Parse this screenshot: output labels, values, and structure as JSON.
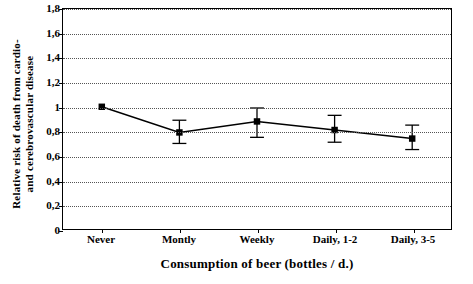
{
  "chart_data": {
    "type": "line",
    "title": "",
    "xlabel": "Consumption of beer (bottles / d.)",
    "ylabel": "Relative risk of death from cardio- and cerebrovascular disease",
    "ylabel_line1": "Relative risk of death from cardio-",
    "ylabel_line2": "and cerebrovascular disease",
    "categories": [
      "Never",
      "Montly",
      "Weekly",
      "Daily, 1-2",
      "Daily, 3-5"
    ],
    "values": [
      1.0,
      0.79,
      0.88,
      0.81,
      0.74
    ],
    "error_low": [
      1.0,
      0.7,
      0.75,
      0.71,
      0.65
    ],
    "error_high": [
      1.0,
      0.89,
      0.99,
      0.93,
      0.85
    ],
    "ylim": [
      0,
      1.8
    ],
    "yticks": [
      "0",
      "0,2",
      "0,4",
      "0,6",
      "0,8",
      "1",
      "1,2",
      "1,4",
      "1,6",
      "1,8"
    ],
    "ytick_values": [
      0,
      0.2,
      0.4,
      0.6,
      0.8,
      1.0,
      1.2,
      1.4,
      1.6,
      1.8
    ],
    "grid": true,
    "legend": "none",
    "marker": "square",
    "series_color": "#000000",
    "grid_color": "#555555"
  }
}
